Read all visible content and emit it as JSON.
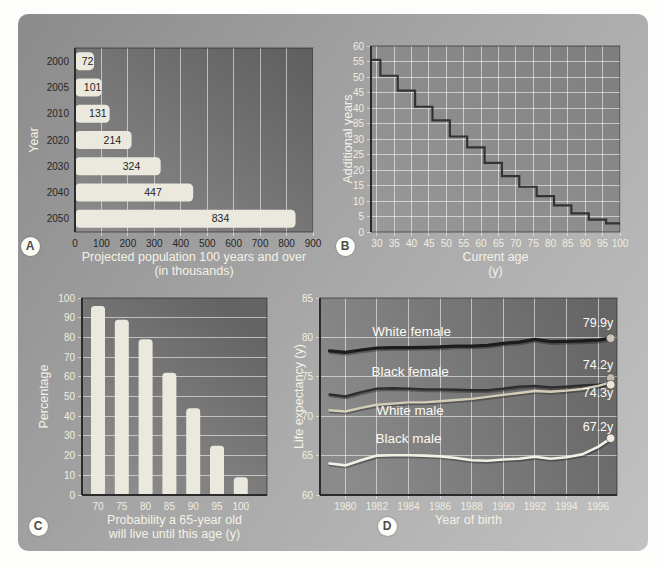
{
  "figure": {
    "panels": {
      "a": {
        "badge": "A"
      },
      "b": {
        "badge": "B"
      },
      "c": {
        "badge": "C"
      },
      "d": {
        "badge": "D"
      }
    }
  },
  "colors": {
    "bar_fill": "#ebe8de",
    "light_text": "#f0eee0",
    "dark_text": "#272727",
    "grid": "rgba(255,255,255,0.55)",
    "step_line": "#333333",
    "axis": "#2b2b2b",
    "marker_stroke": "rgba(70,68,58,0.8)"
  },
  "chart_data": [
    {
      "id": "A",
      "type": "bar",
      "orientation": "horizontal",
      "ylabel": "Year",
      "xlabel": "Projected population 100 years and over",
      "xlabel_line2": "(in thousands)",
      "categories": [
        "2000",
        "2005",
        "2010",
        "2020",
        "2030",
        "2040",
        "2050"
      ],
      "values": [
        72,
        101,
        131,
        214,
        324,
        447,
        834
      ],
      "bar_value_labels": [
        "72",
        "101",
        "131",
        "214",
        "324",
        "447",
        "834"
      ],
      "xlim": [
        0,
        900
      ],
      "xticks": [
        0,
        100,
        200,
        300,
        400,
        500,
        600,
        700,
        800,
        900
      ],
      "grid": "vertical",
      "legend": "none"
    },
    {
      "id": "B",
      "type": "step",
      "ylabel": "Additional years",
      "xlabel": "Current age",
      "xlabel_line2": "(y)",
      "xlim": [
        28.3,
        100
      ],
      "ylim": [
        0,
        60
      ],
      "xticks": [
        30,
        35,
        40,
        45,
        50,
        55,
        60,
        65,
        70,
        75,
        80,
        85,
        90,
        95,
        100
      ],
      "yticks": [
        0,
        5,
        10,
        15,
        20,
        25,
        30,
        35,
        40,
        45,
        50,
        55,
        60
      ],
      "grid": "both",
      "steps": [
        [
          28.3,
          55.5
        ],
        [
          31,
          50.4
        ],
        [
          36,
          45.6
        ],
        [
          41,
          40.4
        ],
        [
          46,
          36.0
        ],
        [
          51,
          30.8
        ],
        [
          56,
          27.3
        ],
        [
          61,
          22.3
        ],
        [
          66,
          18.0
        ],
        [
          71,
          14.6
        ],
        [
          76,
          11.6
        ],
        [
          81,
          8.6
        ],
        [
          86,
          6.0
        ],
        [
          91,
          4.0
        ],
        [
          96,
          2.8
        ]
      ]
    },
    {
      "id": "C",
      "type": "bar",
      "orientation": "vertical",
      "ylabel": "Percentage",
      "xlabel": "Probability a 65-year old",
      "xlabel_line2": "will live until this age (y)",
      "categories": [
        "70",
        "75",
        "80",
        "85",
        "90",
        "95",
        "100"
      ],
      "values": [
        96,
        89,
        79,
        62,
        44,
        25,
        9
      ],
      "ylim": [
        0,
        100
      ],
      "yticks": [
        0,
        10,
        20,
        30,
        40,
        50,
        60,
        70,
        80,
        90,
        100
      ],
      "grid": "horizontal"
    },
    {
      "id": "D",
      "type": "line",
      "ylabel": "Life expectancy (y)",
      "xlabel": "Year of birth",
      "xlim": [
        1978.4,
        1997.2
      ],
      "ylim": [
        60,
        85
      ],
      "xticks": [
        1980,
        1982,
        1984,
        1986,
        1988,
        1990,
        1992,
        1994,
        1996
      ],
      "yticks": [
        60,
        65,
        70,
        75,
        80,
        85
      ],
      "grid_h_lines": [
        65,
        70,
        75,
        80
      ],
      "grid": "both",
      "series": [
        {
          "name": "White female",
          "color": "#1c1c1c",
          "width": 3.2,
          "marker_color": "#c9c6b8",
          "marker_y": 79.9,
          "label_pos": [
            1984.2,
            80.15
          ],
          "end_label": "79.9y",
          "end_label_pos": [
            1996.0,
            81.35
          ],
          "points": [
            [
              1979,
              78.3
            ],
            [
              1980,
              78.1
            ],
            [
              1981,
              78.4
            ],
            [
              1982,
              78.65
            ],
            [
              1983,
              78.7
            ],
            [
              1984,
              78.7
            ],
            [
              1985,
              78.75
            ],
            [
              1986,
              78.8
            ],
            [
              1987,
              78.9
            ],
            [
              1988,
              78.9
            ],
            [
              1989,
              79.0
            ],
            [
              1990,
              79.25
            ],
            [
              1991,
              79.4
            ],
            [
              1992,
              79.75
            ],
            [
              1993,
              79.45
            ],
            [
              1994,
              79.5
            ],
            [
              1995,
              79.55
            ],
            [
              1996,
              79.65
            ],
            [
              1996.8,
              79.9
            ]
          ]
        },
        {
          "name": "Black female",
          "color": "#2d2d2d",
          "width": 2.4,
          "marker_color": "#bdbab0",
          "marker_y": 74.85,
          "label_pos": [
            1984.1,
            75.15
          ],
          "end_label": "74.2y",
          "end_label_pos": [
            1996.0,
            75.95
          ],
          "points": [
            [
              1979,
              72.75
            ],
            [
              1980,
              72.5
            ],
            [
              1981,
              73.05
            ],
            [
              1982,
              73.5
            ],
            [
              1983,
              73.55
            ],
            [
              1984,
              73.5
            ],
            [
              1985,
              73.4
            ],
            [
              1986,
              73.4
            ],
            [
              1987,
              73.35
            ],
            [
              1988,
              73.3
            ],
            [
              1989,
              73.3
            ],
            [
              1990,
              73.5
            ],
            [
              1991,
              73.75
            ],
            [
              1992,
              73.85
            ],
            [
              1993,
              73.65
            ],
            [
              1994,
              73.75
            ],
            [
              1995,
              73.9
            ],
            [
              1996,
              74.0
            ],
            [
              1996.8,
              74.2
            ]
          ]
        },
        {
          "name": "White male",
          "color": "#d3cdb9",
          "width": 2.4,
          "marker_color": "#eae7d8",
          "marker_y": 74.0,
          "label_pos": [
            1984.1,
            70.15
          ],
          "end_label": "74.3y",
          "end_label_pos": [
            1996.0,
            72.45
          ],
          "points": [
            [
              1979,
              70.75
            ],
            [
              1980,
              70.6
            ],
            [
              1981,
              71.05
            ],
            [
              1982,
              71.45
            ],
            [
              1983,
              71.6
            ],
            [
              1984,
              71.75
            ],
            [
              1985,
              71.75
            ],
            [
              1986,
              71.9
            ],
            [
              1987,
              72.05
            ],
            [
              1988,
              72.2
            ],
            [
              1989,
              72.45
            ],
            [
              1990,
              72.7
            ],
            [
              1991,
              72.95
            ],
            [
              1992,
              73.2
            ],
            [
              1993,
              73.1
            ],
            [
              1994,
              73.25
            ],
            [
              1995,
              73.45
            ],
            [
              1996,
              73.85
            ],
            [
              1996.8,
              74.3
            ]
          ]
        },
        {
          "name": "Black male",
          "color": "#f3f1e5",
          "width": 2.6,
          "marker_color": "#efecdf",
          "marker_y": 67.2,
          "label_pos": [
            1984.0,
            66.65
          ],
          "end_label": "67.2y",
          "end_label_pos": [
            1996.0,
            68.15
          ],
          "points": [
            [
              1979,
              64.0
            ],
            [
              1980,
              63.75
            ],
            [
              1981,
              64.4
            ],
            [
              1982,
              65.0
            ],
            [
              1983,
              65.05
            ],
            [
              1984,
              65.05
            ],
            [
              1985,
              65.0
            ],
            [
              1986,
              64.9
            ],
            [
              1987,
              64.7
            ],
            [
              1988,
              64.4
            ],
            [
              1989,
              64.35
            ],
            [
              1990,
              64.5
            ],
            [
              1991,
              64.6
            ],
            [
              1992,
              64.85
            ],
            [
              1993,
              64.6
            ],
            [
              1994,
              64.8
            ],
            [
              1995,
              65.15
            ],
            [
              1996,
              66.1
            ],
            [
              1996.8,
              67.2
            ]
          ]
        }
      ]
    }
  ]
}
